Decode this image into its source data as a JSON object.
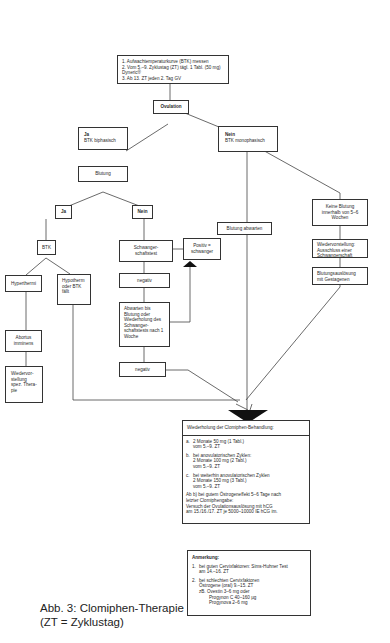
{
  "start_box": {
    "lines": [
      "1. Aufwachtemperaturkurve (BTK) messen",
      "2. Vom 5.–9. Zyklustag (ZT) tägl. 1 Tabl. (50 mg) Dyneric®",
      "3. Ab 13. ZT jeden 2. Tag GV"
    ]
  },
  "ovulation": "Ovulation",
  "yes_branch": {
    "label": "Ja",
    "sub": "BTK biphasisch"
  },
  "no_branch": {
    "label": "Nein",
    "sub": "BTK monophasisch"
  },
  "blutung": "Blutung",
  "blutung_ja": "Ja",
  "blutung_nein": "Nein",
  "btk": "BTK",
  "hyperthermie": "Hyperthermi",
  "hypotherm": "Hypotherm oder BTK fällt",
  "abortus": "Abortus imminens",
  "wiedervorstellung_left": "Wiedervor-stellung spez. Thera-pie",
  "schwangerschaftstest": "Schwanger-schaftstest",
  "positiv": "Positiv = schwanger",
  "negativ_1": "negativ",
  "abwarten": "Abwarten bis Blutung oder Wiederholung des Schwanger-schaftstests nach 1 Woche",
  "negativ_2": "negativ",
  "blutung_abwarten": "Blutung abwarten",
  "keine_blutung": "Keine Blutung innerhalb von 5–6 Wochen",
  "wiedervorstellung_right": "Wiedervorstellung: Ausschluss einer Schwangerschaft",
  "blutungsausloesung": "Blutungsauslösung mit Gestagenen",
  "repeat_box": {
    "title": "Wiederholung der Clomiphen-Behandlung:",
    "items": [
      {
        "label": "a.",
        "lines": [
          "2 Monate 50 mg (1 Tabl.)",
          "vom 5.–9. ZT"
        ]
      },
      {
        "label": "b.",
        "lines": [
          "bei anovulatorischen Zyklen:",
          "2 Monate 100 mg (2 Tabl.)",
          "vom 5.–9. ZT"
        ]
      },
      {
        "label": "c.",
        "lines": [
          "bei weiterhin anovulatorischen Zyklen",
          "2 Monate 150 mg (3 Tabl.)",
          "vom 5.–9. ZT"
        ]
      }
    ],
    "footer": [
      "Ab b) bei gutem Östrogeneffekt 5–6 Tage nach",
      "letzter Clomiphengabe:",
      "Versuch der Ovulationsauslösung mit hCG",
      "am 15./16./17. ZT je 5000–10000 IE hCG im."
    ]
  },
  "note_box": {
    "title": "Anmerkung:",
    "items": [
      {
        "label": "1.",
        "lines": [
          "bei guten Cervixfaktoren: Sims-Huhner Test",
          "am 14.–16. ZT"
        ]
      },
      {
        "label": "2.",
        "lines": [
          "bei schlechten Cervixfaktoren",
          "Östrogene (oral) 9.–15. ZT",
          "zB. Ovestin 3–6 mg oder",
          "Progynon C 40–160 µg",
          "Progynova 2–6 mg"
        ]
      }
    ]
  },
  "caption": {
    "line1": "Abb. 3: Clomiphen-Therapie",
    "line2": "(ZT = Zyklustag)"
  }
}
